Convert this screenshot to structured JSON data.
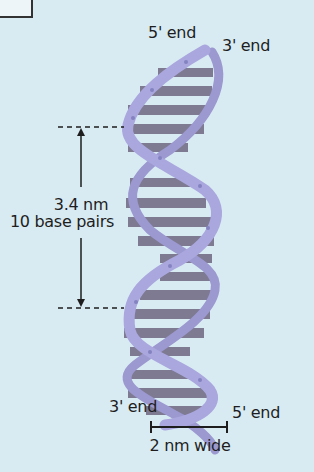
{
  "diagram": {
    "labels": {
      "top_left_end": "5' end",
      "top_right_end": "3' end",
      "bottom_left_end": "3' end",
      "bottom_right_end": "5' end",
      "pitch_length": "3.4 nm",
      "pitch_bases": "10 base pairs",
      "width": "2 nm wide"
    },
    "colors": {
      "background": "#d8ebf2",
      "backbone": "#a9a6dc",
      "base_pair": "#7d7a92",
      "annotation": "#1e1e1e"
    }
  }
}
